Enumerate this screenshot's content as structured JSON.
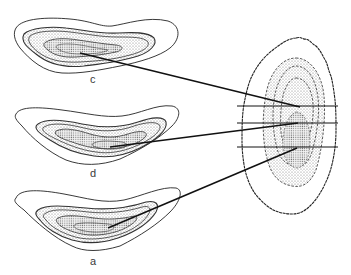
{
  "figure": {
    "type": "anatomical section diagram",
    "background": "#ffffff",
    "ink_color": "#1a1a1a",
    "stipple_color": "#8a8a8a",
    "sections": [
      {
        "id": "c",
        "label": "c",
        "position": "top"
      },
      {
        "id": "d",
        "label": "d",
        "position": "middle"
      },
      {
        "id": "a",
        "label": "a",
        "position": "bottom"
      }
    ],
    "reference_shape": {
      "description": "vertical oval organ outline with wavy edge and dashed internal layers",
      "cut_lines": 3
    },
    "leader_lines": [
      {
        "from": "c",
        "to": "cut-line-1"
      },
      {
        "from": "d",
        "to": "cut-line-2"
      },
      {
        "from": "a",
        "to": "cut-line-3"
      }
    ]
  }
}
